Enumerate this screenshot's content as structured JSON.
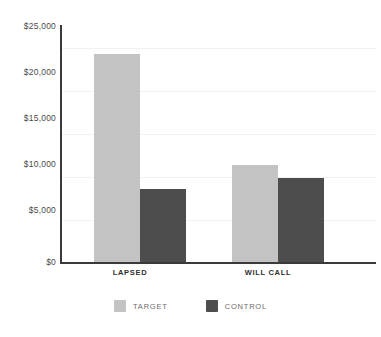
{
  "chart_data": {
    "type": "bar",
    "title": "",
    "subtitle": "",
    "xlabel": "",
    "ylabel": "",
    "categories": [
      "LAPSED",
      "WILL CALL"
    ],
    "series": [
      {
        "name": "TARGET",
        "color": "#c3c3c3",
        "values": [
          24300,
          11350
        ]
      },
      {
        "name": "CONTROL",
        "color": "#4d4d4d",
        "values": [
          8600,
          9900
        ]
      }
    ],
    "ylim": [
      0,
      27500
    ],
    "ytick_values": [
      25000,
      20000,
      15000,
      10000,
      5000,
      0
    ],
    "ytick_labels": [
      "$25,000",
      "$20,000",
      "$15,000",
      "$10,000",
      "$5,000",
      "$0"
    ],
    "grid": true,
    "grid_axis": "y",
    "legend_position": "bottom",
    "annotations": []
  },
  "legend": {
    "items": [
      {
        "label": "TARGET",
        "swatch": "legend-swatch-target"
      },
      {
        "label": "CONTROL",
        "swatch": "legend-swatch-control"
      }
    ]
  },
  "colors": {
    "target": "#c3c3c3",
    "control": "#4d4d4d",
    "axis": "#3a3a3a",
    "gridline": "#f2f2f4",
    "tick_text": "#4a4a4a",
    "category_text": "#2f2f2f",
    "legend_text": "#6d6d6d",
    "background": "#ffffff"
  }
}
